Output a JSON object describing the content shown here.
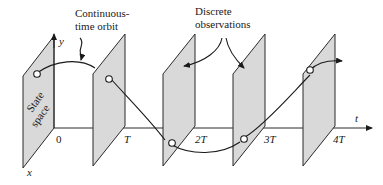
{
  "diagram": {
    "annotations": {
      "continuous_line1": "Continuous-",
      "continuous_line2": "time orbit",
      "discrete_line1": "Discrete",
      "discrete_line2": "observations",
      "state_line1": "State",
      "state_line2": "space"
    },
    "axes": {
      "x_label": "x",
      "y_label": "y",
      "t_label": "t"
    },
    "time_ticks": [
      "0",
      "T",
      "2T",
      "3T",
      "4T"
    ]
  }
}
